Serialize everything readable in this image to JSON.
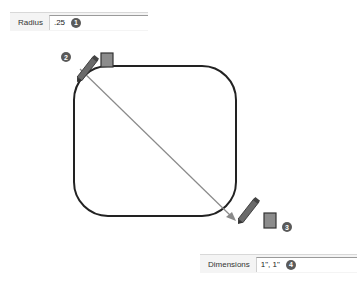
{
  "radius_box": {
    "label": "Radius",
    "value": ".25",
    "step": "1"
  },
  "dimensions_box": {
    "label": "Dimensions",
    "value": "1\", 1\"",
    "step": "4"
  },
  "steps": {
    "start_step": "2",
    "end_step": "3"
  },
  "icons": {
    "start_cursor": "pencil-icon",
    "end_cursor": "pencil-icon",
    "rect_tool": "rectangle-tool-icon"
  },
  "colors": {
    "shape_stroke": "#222222",
    "diagonal_stroke": "#8a8a8a",
    "badge_bg": "#5a5a5a",
    "tool_fill": "#8c8c8c"
  }
}
